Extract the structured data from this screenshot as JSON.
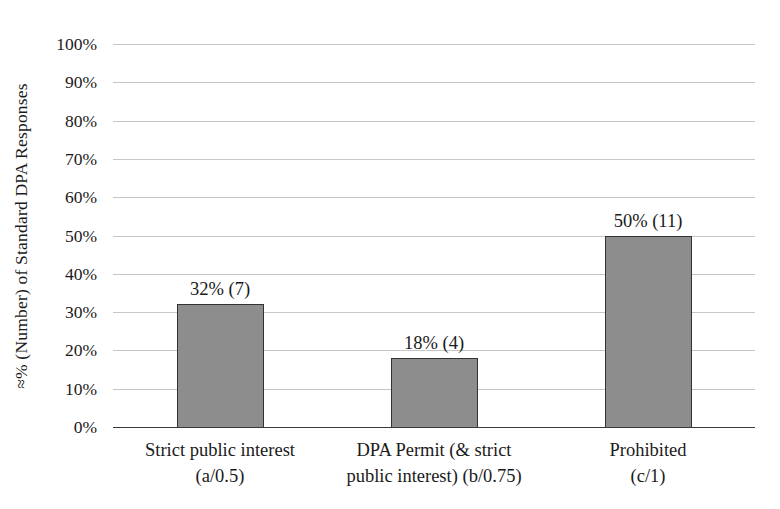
{
  "chart_data": {
    "type": "bar",
    "title": "",
    "ylabel": "≈% (Number) of Standard DPA Responses",
    "xlabel": "",
    "ylim": [
      0,
      100
    ],
    "ytick_step": 10,
    "ytick_labels": [
      "0%",
      "10%",
      "20%",
      "30%",
      "40%",
      "50%",
      "60%",
      "70%",
      "80%",
      "90%",
      "100%"
    ],
    "grid": true,
    "legend": "none",
    "categories": [
      "Strict public interest (a/0.5)",
      "DPA Permit (& strict public interest) (b/0.75)",
      "Prohibited (c/1)"
    ],
    "category_lines": [
      [
        "Strict public interest",
        "(a/0.5)"
      ],
      [
        "DPA Permit (& strict",
        "public interest) (b/0.75)"
      ],
      [
        "Prohibited",
        "(c/1)"
      ]
    ],
    "values": [
      32,
      18,
      50
    ],
    "counts": [
      7,
      4,
      11
    ],
    "bar_labels": [
      "32% (7)",
      "18% (4)",
      "50% (11)"
    ],
    "colors": {
      "bar_fill": "#8d8d8d",
      "bar_border": "#333333",
      "gridline": "#c6c6c6",
      "axis_line": "#3a3a3a",
      "text": "#1a1a1a",
      "background": "#ffffff"
    }
  }
}
